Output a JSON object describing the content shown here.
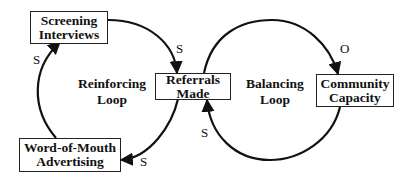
{
  "diagram": {
    "type": "causal-loop-diagram",
    "nodes": [
      {
        "id": "screening",
        "line1": "Screening",
        "line2": "Interviews"
      },
      {
        "id": "referrals",
        "line1": "Referrals",
        "line2": "Made"
      },
      {
        "id": "wom",
        "line1": "Word-of-Mouth",
        "line2": "Advertising"
      },
      {
        "id": "capacity",
        "line1": "Community",
        "line2": "Capacity"
      }
    ],
    "loops": [
      {
        "id": "reinforcing",
        "line1": "Reinforcing",
        "line2": "Loop"
      },
      {
        "id": "balancing",
        "line1": "Balancing",
        "line2": "Loop"
      }
    ],
    "links": [
      {
        "from": "Screening Interviews",
        "to": "Referrals Made",
        "polarity": "S"
      },
      {
        "from": "Referrals Made",
        "to": "Word-of-Mouth Advertising",
        "polarity": "S"
      },
      {
        "from": "Word-of-Mouth Advertising",
        "to": "Screening Interviews",
        "polarity": "S"
      },
      {
        "from": "Referrals Made",
        "to": "Community Capacity",
        "polarity": "O"
      },
      {
        "from": "Community Capacity",
        "to": "Referrals Made",
        "polarity": "S"
      }
    ],
    "colors": {
      "stroke": "#111111",
      "background": "#ffffff"
    }
  }
}
